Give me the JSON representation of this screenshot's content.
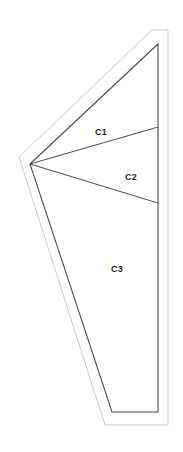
{
  "document": {
    "title": "Shape Partition Diagram",
    "background_color": "#ffffff",
    "width": 183,
    "height": 452
  },
  "style": {
    "outer_outline_color": "#c9c9c9",
    "outer_outline_width": 1,
    "inner_outline_color": "#4a4a4a",
    "inner_outline_width": 1.1,
    "divider_color": "#4a4a4a",
    "divider_width": 1,
    "fill_color": "#ffffff",
    "label_color": "#1a1a1a"
  },
  "outer_shape": {
    "name": "outer-offset-outline",
    "points": "168,30 152,30 19,157 105,425 168,425"
  },
  "inner_shape": {
    "name": "main-wedge-outline",
    "points": "158,44 30,164 112,412 158,412"
  },
  "dividers": [
    {
      "name": "divider-c1-c2",
      "x1": 30,
      "y1": 164,
      "x2": 158,
      "y2": 127
    },
    {
      "name": "divider-c2-c3",
      "x1": 30,
      "y1": 164,
      "x2": 158,
      "y2": 203
    }
  ],
  "regions": [
    {
      "id": "c1",
      "label": "C1",
      "x": 101,
      "y": 132
    },
    {
      "id": "c2",
      "label": "C2",
      "x": 131,
      "y": 177
    },
    {
      "id": "c3",
      "label": "C3",
      "x": 117,
      "y": 269
    }
  ]
}
